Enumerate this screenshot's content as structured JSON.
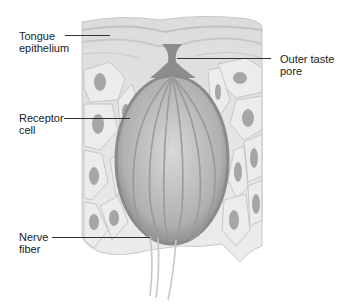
{
  "diagram": {
    "labels": [
      {
        "id": "tongue-epithelium",
        "line1": "Tongue",
        "line2": "epithelium"
      },
      {
        "id": "outer-taste-pore",
        "line1": "Outer taste",
        "line2": "pore"
      },
      {
        "id": "receptor-cell",
        "line1": "Receptor",
        "line2": "cell"
      },
      {
        "id": "nerve-fiber",
        "line1": "Nerve",
        "line2": "fiber"
      }
    ]
  },
  "colors": {
    "background": "#ffffff",
    "tissue_light": "#e8e8e8",
    "tissue_mid": "#c4c4c4",
    "tissue_dark": "#8a8a8a",
    "leader_line": "#333333",
    "text": "#222222"
  }
}
